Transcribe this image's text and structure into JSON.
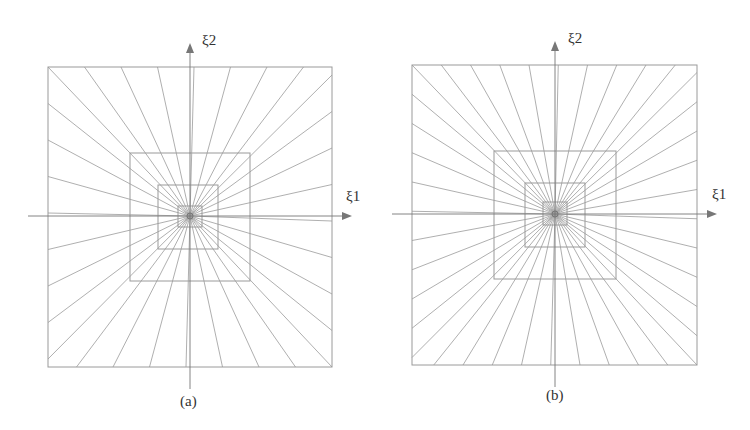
{
  "panels": [
    {
      "id": "a",
      "caption": "(a)",
      "axis_x": "ξ1",
      "axis_y": "ξ2",
      "center": [
        190,
        216
      ],
      "outer": [
        48,
        67,
        332,
        367
      ],
      "squares": [
        [
          130,
          153,
          250,
          281
        ],
        [
          158,
          185,
          218,
          249
        ],
        [
          178,
          206,
          202,
          227
        ]
      ],
      "rays": 32
    },
    {
      "id": "b",
      "caption": "(b)",
      "axis_x": "ξ1",
      "axis_y": "ξ2",
      "center": [
        555,
        214
      ],
      "outer": [
        412,
        65,
        697,
        365
      ],
      "squares": [
        [
          494,
          151,
          616,
          279
        ],
        [
          525,
          183,
          585,
          247
        ],
        [
          543,
          202,
          567,
          225
        ]
      ],
      "rays": 40
    }
  ],
  "colors": {
    "line": "#9a9a9a",
    "axis": "#777777",
    "text": "#333333"
  }
}
